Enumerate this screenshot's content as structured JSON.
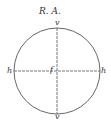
{
  "title": "R. A.",
  "labels": {
    "top": "v",
    "bottom": "v",
    "left": "h",
    "right": "h",
    "center": "f"
  },
  "colors": {
    "stroke": "#444444",
    "text": "#333333"
  }
}
